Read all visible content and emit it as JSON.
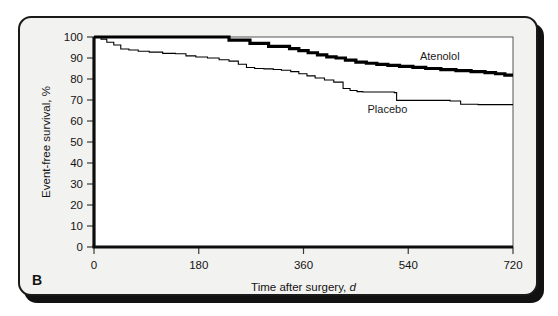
{
  "figure": {
    "panel_letter": "B",
    "background_color": "#f2f2f0",
    "frame_color": "#1a1a1a"
  },
  "chart_data": {
    "type": "line",
    "title": "",
    "subtitle": "",
    "xlabel": "Time after surgery, ",
    "xlabel_unit": "d",
    "ylabel": "Event-free survival, %",
    "xlim": [
      0,
      720
    ],
    "ylim": [
      0,
      100
    ],
    "xticks": [
      0,
      180,
      360,
      540,
      720
    ],
    "xticklabels": [
      "0",
      "180",
      "360",
      "540",
      "720"
    ],
    "yticks": [
      0,
      10,
      20,
      30,
      40,
      50,
      60,
      70,
      80,
      90,
      100
    ],
    "yticklabels": [
      "0",
      "10",
      "20",
      "30",
      "40",
      "50",
      "60",
      "70",
      "80",
      "90",
      "100"
    ],
    "grid": false,
    "legend_position": "inline-annotation",
    "step_style": "post",
    "annotations": [
      {
        "text": "Atenolol",
        "x": 560,
        "y": 89
      },
      {
        "text": "Placebo",
        "x": 470,
        "y": 64
      }
    ],
    "series": [
      {
        "name": "Atenolol",
        "color": "#000000",
        "line_width": 3.2,
        "x": [
          0,
          18,
          30,
          225,
          232,
          255,
          268,
          282,
          300,
          318,
          336,
          352,
          368,
          384,
          400,
          416,
          432,
          450,
          468,
          486,
          505,
          525,
          548,
          570,
          596,
          622,
          648,
          672,
          690,
          706,
          720
        ],
        "y": [
          100,
          100,
          100,
          100,
          98.5,
          98.5,
          97,
          97,
          95.5,
          95.5,
          94.5,
          93.5,
          92.5,
          91.5,
          90.5,
          90,
          89,
          88,
          87.5,
          87,
          86.5,
          86,
          85.5,
          85,
          84.5,
          84,
          83.5,
          83,
          82.5,
          81.8,
          81.8
        ]
      },
      {
        "name": "Placebo",
        "color": "#000000",
        "line_width": 1.1,
        "x": [
          0,
          12,
          22,
          34,
          46,
          60,
          76,
          95,
          118,
          140,
          158,
          175,
          195,
          215,
          232,
          248,
          262,
          276,
          292,
          308,
          322,
          338,
          352,
          366,
          380,
          396,
          412,
          428,
          440,
          452,
          462,
          478,
          500,
          516,
          520,
          560,
          596,
          612,
          630,
          660,
          690,
          720
        ],
        "y": [
          100,
          99,
          97.5,
          96.2,
          94.3,
          93.8,
          93.2,
          92.8,
          92.2,
          92.0,
          91.0,
          90.5,
          90.0,
          89.2,
          88.5,
          87.0,
          85.5,
          85.0,
          84.8,
          84.5,
          84.2,
          83.5,
          82.5,
          81.5,
          80.5,
          79.5,
          78.5,
          75.5,
          74.5,
          74.0,
          73.8,
          73.8,
          73.8,
          73.5,
          69.8,
          69.8,
          69.8,
          69.5,
          68.0,
          67.8,
          67.8,
          67.8
        ]
      }
    ]
  }
}
